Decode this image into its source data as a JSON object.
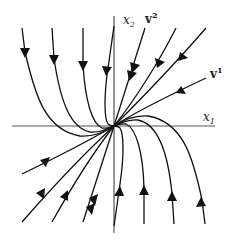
{
  "diagram": {
    "type": "phase-portrait",
    "axes": {
      "x_label": "x",
      "x_sub": "1",
      "y_label": "x",
      "y_sub": "2"
    },
    "eigenvectors": [
      {
        "label": "v",
        "sup": "1"
      },
      {
        "label": "v",
        "sup": "2"
      }
    ],
    "colors": {
      "trajectory": "#111111",
      "axis": "#555555",
      "background": "#ffffff"
    }
  }
}
